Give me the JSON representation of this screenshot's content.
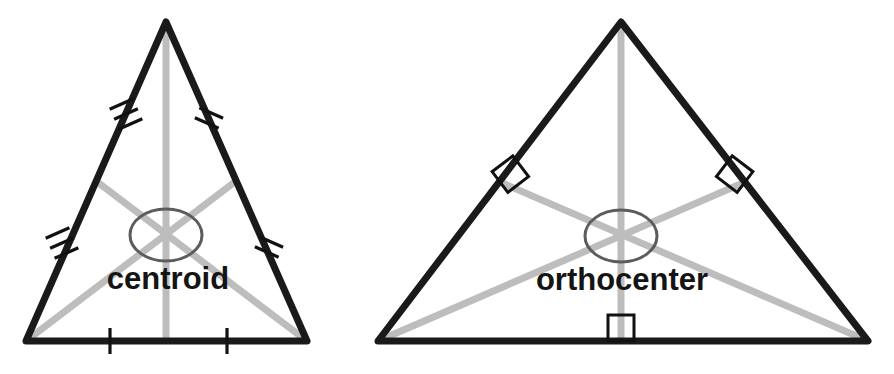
{
  "figure": {
    "background_color": "#ffffff",
    "side_color": "#1a1a1a",
    "cevian_color": "#bdbdbd",
    "ellipse_color": "#5c5c5c",
    "tick_color": "#111111",
    "label_color": "#141414"
  },
  "diagrams": [
    {
      "id": "centroid-diagram",
      "label": "centroid",
      "label_x": 168,
      "label_y": 289,
      "cevian_type": "median",
      "vertices": {
        "apex": {
          "x": 166,
          "y": 22
        },
        "base_left": {
          "x": 26,
          "y": 341
        },
        "base_right": {
          "x": 307,
          "y": 341
        }
      },
      "midpoints": {
        "left_side": {
          "x": 96,
          "y": 181
        },
        "right_side": {
          "x": 236,
          "y": 181
        },
        "base": {
          "x": 166,
          "y": 341
        }
      },
      "center_point": {
        "x": 166,
        "y": 235
      },
      "ellipse": {
        "cx": 166,
        "cy": 235,
        "rx": 36,
        "ry": 26
      },
      "tick_groups": [
        {
          "name": "upper-left-side",
          "count": 3,
          "at_x": 126,
          "at_y": 114,
          "angle": 66
        },
        {
          "name": "upper-right-side",
          "count": 2,
          "at_x": 209,
          "at_y": 118,
          "angle": -66
        },
        {
          "name": "lower-left-side",
          "count": 3,
          "at_x": 62,
          "at_y": 243,
          "angle": 66
        },
        {
          "name": "lower-right-side",
          "count": 2,
          "at_x": 269,
          "at_y": 247,
          "angle": -66
        },
        {
          "name": "base-left-half",
          "count": 1,
          "at_x": 110,
          "at_y": 341,
          "angle": 0
        },
        {
          "name": "base-right-half",
          "count": 1,
          "at_x": 227,
          "at_y": 341,
          "angle": 0
        }
      ]
    },
    {
      "id": "orthocenter-diagram",
      "label": "orthocenter",
      "label_x": 622,
      "label_y": 290,
      "cevian_type": "altitude",
      "vertices": {
        "apex": {
          "x": 621,
          "y": 22
        },
        "base_left": {
          "x": 378,
          "y": 341
        },
        "base_right": {
          "x": 868,
          "y": 341
        }
      },
      "feet": {
        "left_side": {
          "x": 500,
          "y": 182
        },
        "right_side": {
          "x": 745,
          "y": 182
        },
        "base": {
          "x": 621,
          "y": 341
        }
      },
      "center_point": {
        "x": 621,
        "y": 236
      },
      "ellipse": {
        "cx": 621,
        "cy": 236,
        "rx": 36,
        "ry": 26
      },
      "right_angle_marks": [
        {
          "name": "left-altitude-foot",
          "x": 500,
          "y": 182,
          "size": 26,
          "angle": 52.7
        },
        {
          "name": "right-altitude-foot",
          "x": 745,
          "y": 182,
          "size": 26,
          "angle": -52.7
        },
        {
          "name": "base-altitude-foot",
          "x": 621,
          "y": 341,
          "size": 26,
          "angle": 0
        }
      ]
    }
  ]
}
